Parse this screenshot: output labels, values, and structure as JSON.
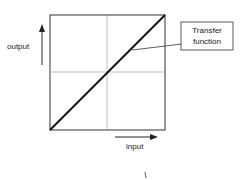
{
  "diagram": {
    "y_label": "output",
    "x_label": "input",
    "callout_line1": "Transfer",
    "callout_line2": "function",
    "colors": {
      "line": "#111111",
      "grid": "#888888",
      "frame": "#333333"
    }
  }
}
